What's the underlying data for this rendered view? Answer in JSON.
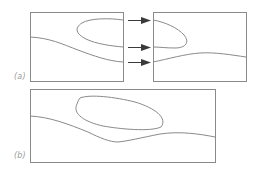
{
  "figure": {
    "panels": [
      {
        "id": "a",
        "label": "(a)",
        "description": "Region containing a closed loop contour and a wavy boundary; split into two halves with arrows showing the mapping of boundary crossings"
      },
      {
        "id": "b",
        "label": "(b)",
        "description": "Combined wide region with closed loop contour and wavy boundary curve"
      }
    ],
    "arrows": {
      "count": 3,
      "direction": "right"
    },
    "colors": {
      "line": "#8a8a8a",
      "arrow": "#3a3a3a",
      "label": "#9a9a9a",
      "background": "#ffffff"
    }
  }
}
